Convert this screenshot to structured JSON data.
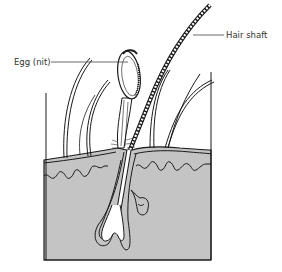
{
  "diagram": {
    "labels": {
      "egg": "Egg (nit)",
      "hair_shaft": "Hair shaft"
    },
    "colors": {
      "skin_fill": "#c4c4c4",
      "line": "#1a1a1a",
      "label_line": "#444444",
      "background": "#ffffff"
    }
  }
}
